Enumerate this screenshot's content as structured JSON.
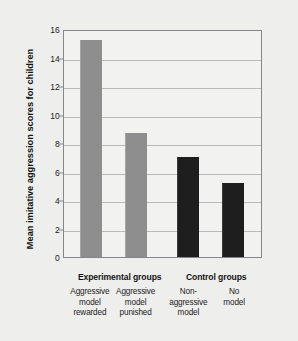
{
  "chart_data": {
    "type": "bar",
    "title": "",
    "xlabel": "",
    "ylabel": "Mean imitative aggression scores for children",
    "ylim": [
      0,
      16
    ],
    "yticks": [
      0,
      2,
      4,
      6,
      8,
      10,
      12,
      14,
      16
    ],
    "grid": true,
    "legend": "none",
    "categories": [
      "Aggressive model rewarded",
      "Aggressive model punished",
      "Non-aggressive model",
      "No model"
    ],
    "category_lines": [
      [
        "Aggressive",
        "model",
        "rewarded"
      ],
      [
        "Aggressive",
        "model",
        "punished"
      ],
      [
        "Non-",
        "aggressive",
        "model"
      ],
      [
        "No",
        "model"
      ]
    ],
    "values": [
      15.2,
      8.7,
      7.0,
      5.2
    ],
    "bar_colors": [
      "#8e8e8e",
      "#8e8e8e",
      "#1e1e1e",
      "#1e1e1e"
    ],
    "groups": [
      {
        "label": "Experimental groups",
        "center_pct": 28.5
      },
      {
        "label": "Control groups",
        "center_pct": 77.0
      }
    ],
    "bar_centers_pct": [
      13.5,
      36.5,
      63.0,
      86.0
    ],
    "colors": {
      "gray_bar": "#8e8e8e",
      "dark_bar": "#1e1e1e",
      "gridline": "#b9b9bb",
      "frame": "#86868a",
      "plot_background": "#f2f2f0",
      "page_background": "#eeeeec",
      "text": "#141414"
    }
  }
}
